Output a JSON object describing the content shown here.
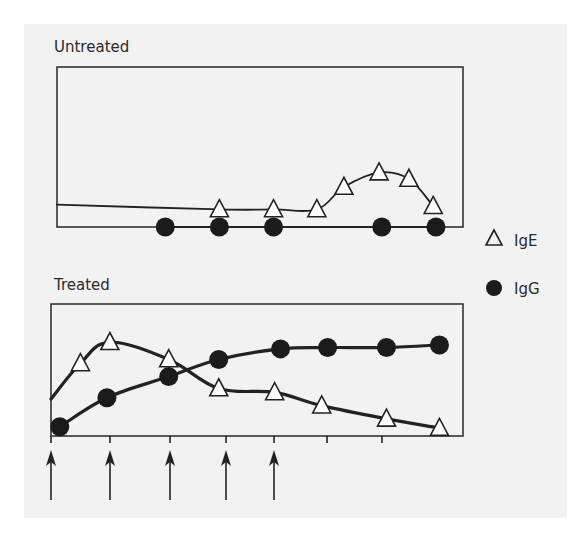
{
  "colors": {
    "background": "#ffffff",
    "panel": "#f2f2f2",
    "ink": "#222222",
    "triangle_fill": "#ffffff"
  },
  "legend": {
    "items": [
      {
        "label": "IgE",
        "marker": "open-triangle"
      },
      {
        "label": "IgG",
        "marker": "filled-circle"
      }
    ]
  },
  "chart_data": [
    {
      "type": "line",
      "title": "Untreated",
      "xlabel": "",
      "ylabel": "",
      "grid": false,
      "legend_position": "right",
      "x_ticks": false,
      "series": [
        {
          "name": "IgE",
          "marker": "open-triangle",
          "line_start": [
            0,
            0.14
          ],
          "points": [
            {
              "x": 3.0,
              "y": 0.11
            },
            {
              "x": 4.0,
              "y": 0.11
            },
            {
              "x": 4.8,
              "y": 0.11
            },
            {
              "x": 5.3,
              "y": 0.25
            },
            {
              "x": 5.95,
              "y": 0.34
            },
            {
              "x": 6.5,
              "y": 0.3
            },
            {
              "x": 6.95,
              "y": 0.13
            }
          ]
        },
        {
          "name": "IgG",
          "marker": "filled-circle",
          "points": [
            {
              "x": 2.0,
              "y": 0
            },
            {
              "x": 3.0,
              "y": 0
            },
            {
              "x": 4.0,
              "y": 0
            },
            {
              "x": 6.0,
              "y": 0
            },
            {
              "x": 7.0,
              "y": 0
            }
          ]
        }
      ]
    },
    {
      "type": "line",
      "title": "Treated",
      "xlabel": "",
      "ylabel": "",
      "grid": false,
      "x_ticks_count": 8,
      "treatment_arrows_at_ticks": [
        0,
        1,
        2,
        3,
        4
      ],
      "series": [
        {
          "name": "IgE",
          "marker": "open-triangle",
          "line_start": [
            0,
            0.28
          ],
          "points": [
            {
              "x": 0.5,
              "y": 0.55
            },
            {
              "x": 1.0,
              "y": 0.71
            },
            {
              "x": 2.0,
              "y": 0.58
            },
            {
              "x": 2.85,
              "y": 0.36
            },
            {
              "x": 3.8,
              "y": 0.33
            },
            {
              "x": 4.6,
              "y": 0.23
            },
            {
              "x": 5.7,
              "y": 0.13
            },
            {
              "x": 6.6,
              "y": 0.06
            }
          ]
        },
        {
          "name": "IgG",
          "marker": "filled-circle",
          "points": [
            {
              "x": 0.15,
              "y": 0.07
            },
            {
              "x": 0.95,
              "y": 0.29
            },
            {
              "x": 2.0,
              "y": 0.45
            },
            {
              "x": 2.85,
              "y": 0.58
            },
            {
              "x": 3.9,
              "y": 0.66
            },
            {
              "x": 4.7,
              "y": 0.67
            },
            {
              "x": 5.7,
              "y": 0.67
            },
            {
              "x": 6.6,
              "y": 0.69
            }
          ]
        }
      ]
    }
  ]
}
